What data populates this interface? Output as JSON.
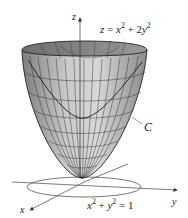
{
  "figure": {
    "surface_equation": {
      "lhs": "z",
      "rhs_a": "x",
      "rhs_a_exp": "2",
      "plus": "+ 2",
      "rhs_b": "y",
      "rhs_b_exp": "2",
      "eq": "="
    },
    "curve_label": "C",
    "base_equation": {
      "a": "x",
      "a_exp": "2",
      "plus": "+",
      "b": "y",
      "b_exp": "2",
      "eq": "= 1"
    },
    "axes": {
      "x": "x",
      "y": "y",
      "z": "z"
    },
    "colors": {
      "surface_light": "#d2d2d2",
      "surface_dark": "#8c8c8c",
      "mesh": "#2a2a2a",
      "axis": "#333333"
    }
  }
}
